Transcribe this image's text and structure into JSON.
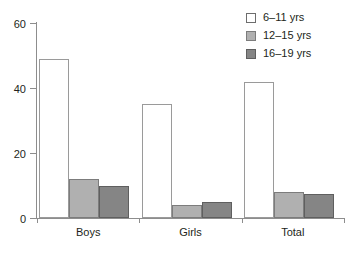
{
  "chart_data": {
    "type": "bar",
    "title": "",
    "subtitle": "",
    "xlabel": "",
    "ylabel": "",
    "categories": [
      "Boys",
      "Girls",
      "Total"
    ],
    "series": [
      {
        "name": "6–11 yrs",
        "values": [
          49,
          35,
          42
        ],
        "color": "#ffffff"
      },
      {
        "name": "12–15 yrs",
        "values": [
          12,
          4,
          8
        ],
        "color": "#b0b0b0"
      },
      {
        "name": "16–19 yrs",
        "values": [
          10,
          5,
          7.5
        ],
        "color": "#858585"
      }
    ],
    "ylim": [
      0,
      60
    ],
    "yticks": [
      0,
      20,
      40,
      60
    ],
    "ytick_labels": [
      "0",
      "20",
      "40",
      "60"
    ],
    "grid": false,
    "legend_position": "top-right"
  },
  "axis": {
    "y_labels": [
      "60",
      "40",
      "20",
      "0"
    ]
  },
  "legend": {
    "items": [
      {
        "label": "6–11 yrs"
      },
      {
        "label": "12–15 yrs"
      },
      {
        "label": "16–19 yrs"
      }
    ]
  }
}
